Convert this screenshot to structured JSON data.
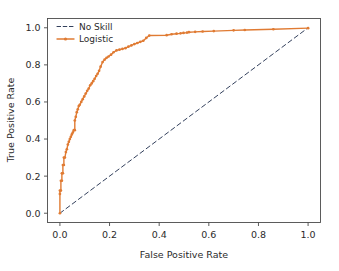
{
  "chart_data": {
    "type": "line",
    "title": "",
    "xlabel": "False Positive Rate",
    "ylabel": "True Positive Rate",
    "xlim": [
      -0.05,
      1.05
    ],
    "ylim": [
      -0.05,
      1.05
    ],
    "xticks": [
      "0.0",
      "0.2",
      "0.4",
      "0.6",
      "0.8",
      "1.0"
    ],
    "xtick_values": [
      0.0,
      0.2,
      0.4,
      0.6,
      0.8,
      1.0
    ],
    "yticks": [
      "0.0",
      "0.2",
      "0.4",
      "0.6",
      "0.8",
      "1.0"
    ],
    "ytick_values": [
      0.0,
      0.2,
      0.4,
      0.6,
      0.8,
      1.0
    ],
    "grid": false,
    "legend_position": "upper left",
    "series": [
      {
        "name": "No Skill",
        "style": "dashed",
        "marker": "none",
        "color": "#33405c",
        "x": [
          0.0,
          1.0
        ],
        "y": [
          0.0,
          1.0
        ]
      },
      {
        "name": "Logistic",
        "style": "solid",
        "marker": "dot",
        "color": "#e07b33",
        "x": [
          0.0,
          0.0,
          0.0,
          0.004,
          0.004,
          0.008,
          0.008,
          0.012,
          0.012,
          0.016,
          0.016,
          0.02,
          0.024,
          0.028,
          0.032,
          0.036,
          0.04,
          0.044,
          0.048,
          0.052,
          0.056,
          0.06,
          0.06,
          0.064,
          0.068,
          0.072,
          0.076,
          0.08,
          0.086,
          0.092,
          0.098,
          0.104,
          0.11,
          0.116,
          0.122,
          0.128,
          0.134,
          0.14,
          0.146,
          0.152,
          0.158,
          0.164,
          0.172,
          0.18,
          0.188,
          0.196,
          0.206,
          0.216,
          0.228,
          0.24,
          0.252,
          0.264,
          0.276,
          0.288,
          0.3,
          0.312,
          0.324,
          0.336,
          0.348,
          0.36,
          0.43,
          0.45,
          0.47,
          0.486,
          0.498,
          0.512,
          0.52,
          0.545,
          0.575,
          0.62,
          0.7,
          0.745,
          0.86,
          1.0
        ],
        "y": [
          0.0,
          0.104,
          0.122,
          0.122,
          0.175,
          0.175,
          0.215,
          0.215,
          0.26,
          0.26,
          0.3,
          0.3,
          0.33,
          0.345,
          0.37,
          0.385,
          0.4,
          0.412,
          0.425,
          0.435,
          0.448,
          0.448,
          0.5,
          0.52,
          0.545,
          0.56,
          0.578,
          0.585,
          0.6,
          0.615,
          0.63,
          0.645,
          0.66,
          0.672,
          0.69,
          0.7,
          0.712,
          0.725,
          0.74,
          0.752,
          0.768,
          0.79,
          0.815,
          0.828,
          0.838,
          0.845,
          0.855,
          0.868,
          0.878,
          0.882,
          0.886,
          0.89,
          0.898,
          0.905,
          0.912,
          0.918,
          0.924,
          0.93,
          0.945,
          0.958,
          0.96,
          0.965,
          0.968,
          0.97,
          0.972,
          0.974,
          0.976,
          0.978,
          0.98,
          0.982,
          0.986,
          0.988,
          0.992,
          0.998
        ]
      }
    ]
  },
  "legend": {
    "entries": [
      {
        "label": "No Skill"
      },
      {
        "label": "Logistic"
      }
    ]
  },
  "colors": {
    "logistic": "#e07b33",
    "no_skill": "#33405c",
    "axis": "#4a4a4a",
    "text": "#2b2b2b",
    "background": "#ffffff"
  }
}
